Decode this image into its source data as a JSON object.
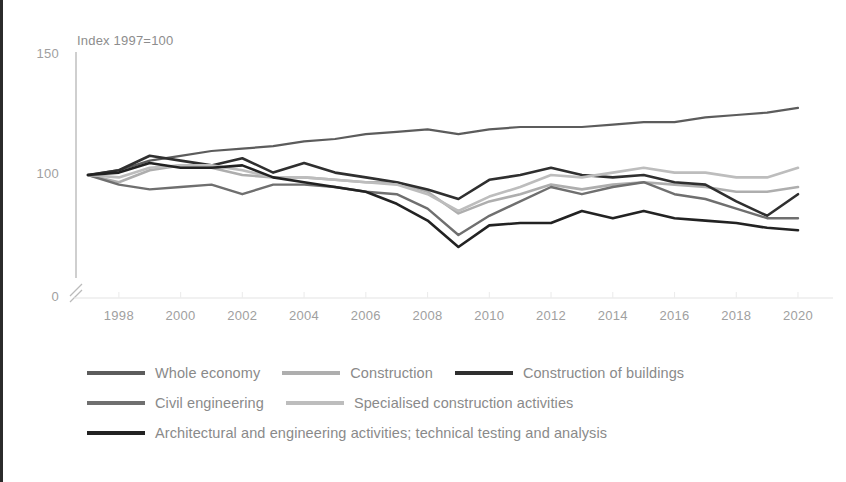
{
  "chart_data": {
    "type": "line",
    "title": "",
    "subtitle": "",
    "axis_note": "Index 1997=100",
    "xlabel": "",
    "ylabel": "",
    "x": [
      1997,
      1998,
      1999,
      2000,
      2001,
      2002,
      2003,
      2004,
      2005,
      2006,
      2007,
      2008,
      2009,
      2010,
      2011,
      2012,
      2013,
      2014,
      2015,
      2016,
      2017,
      2018,
      2019,
      2020
    ],
    "xtick_labels": [
      "1998",
      "2000",
      "2002",
      "2004",
      "2006",
      "2008",
      "2010",
      "2012",
      "2014",
      "2016",
      "2018",
      "2020"
    ],
    "xticks": [
      1998,
      2000,
      2002,
      2004,
      2006,
      2008,
      2010,
      2012,
      2014,
      2016,
      2018,
      2020
    ],
    "ytick_labels": [
      "0",
      "100",
      "150"
    ],
    "yticks": [
      0,
      100,
      150
    ],
    "ylim": [
      90,
      155
    ],
    "axis_break": true,
    "grid": false,
    "legend_position": "bottom",
    "series": [
      {
        "name": "Whole economy",
        "color": "#5c5c5c",
        "width": 2.2,
        "values": [
          100,
          102,
          106,
          108,
          110,
          111,
          112,
          114,
          115,
          117,
          118,
          119,
          117,
          119,
          120,
          120,
          120,
          121,
          122,
          122,
          124,
          125,
          126,
          128
        ]
      },
      {
        "name": "Construction",
        "color": "#aeaeae",
        "width": 2.6,
        "values": [
          100,
          97,
          102,
          104,
          103,
          100,
          99,
          99,
          98,
          97,
          97,
          93,
          84,
          89,
          92,
          96,
          94,
          96,
          97,
          96,
          95,
          93,
          93,
          95
        ]
      },
      {
        "name": "Construction of buildings",
        "color": "#2f2f2f",
        "width": 2.6,
        "values": [
          100,
          102,
          108,
          106,
          104,
          107,
          101,
          105,
          101,
          99,
          97,
          94,
          90,
          98,
          100,
          103,
          100,
          99,
          100,
          97,
          96,
          89,
          83,
          92
        ]
      },
      {
        "name": "Civil engineering",
        "color": "#6f6f6f",
        "width": 2.4,
        "values": [
          100,
          96,
          94,
          95,
          96,
          92,
          96,
          96,
          95,
          93,
          92,
          86,
          75,
          83,
          89,
          95,
          92,
          95,
          97,
          92,
          90,
          86,
          82,
          82
        ]
      },
      {
        "name": "Specialised construction activities",
        "color": "#bdbdbd",
        "width": 2.6,
        "values": [
          100,
          99,
          103,
          104,
          104,
          102,
          99,
          99,
          98,
          97,
          96,
          92,
          85,
          91,
          95,
          100,
          99,
          101,
          103,
          101,
          101,
          99,
          99,
          103
        ]
      },
      {
        "name": "Architectural and engineering activities; technical testing and analysis",
        "color": "#222222",
        "width": 2.6,
        "values": [
          100,
          101,
          105,
          103,
          103,
          104,
          99,
          97,
          95,
          93,
          88,
          81,
          70,
          79,
          80,
          80,
          85,
          82,
          85,
          82,
          81,
          80,
          78,
          77
        ]
      }
    ]
  },
  "legend": {
    "rows": [
      [
        {
          "label": "Whole economy",
          "color": "#5c5c5c"
        },
        {
          "label": "Construction",
          "color": "#aeaeae"
        },
        {
          "label": "Construction of buildings",
          "color": "#2f2f2f"
        }
      ],
      [
        {
          "label": "Civil engineering",
          "color": "#6f6f6f"
        },
        {
          "label": "Specialised construction activities",
          "color": "#bdbdbd"
        }
      ],
      [
        {
          "label": "Architectural and engineering activities; technical testing and analysis",
          "color": "#222222"
        }
      ]
    ]
  }
}
